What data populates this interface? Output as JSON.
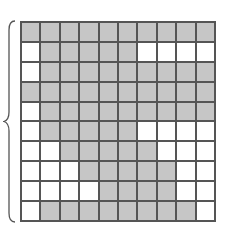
{
  "figure": {
    "rows": 10,
    "cols": 10,
    "colors": {
      "shaded": "#c6c6c6",
      "empty": "#ffffff",
      "line": "#555555"
    },
    "grid": [
      [
        1,
        1,
        1,
        1,
        1,
        1,
        1,
        1,
        1,
        1
      ],
      [
        0,
        1,
        1,
        1,
        1,
        1,
        0,
        0,
        0,
        0
      ],
      [
        0,
        1,
        1,
        1,
        1,
        1,
        1,
        1,
        1,
        1
      ],
      [
        1,
        1,
        1,
        1,
        1,
        1,
        1,
        1,
        1,
        1
      ],
      [
        0,
        1,
        1,
        1,
        1,
        1,
        1,
        1,
        1,
        1
      ],
      [
        0,
        1,
        1,
        1,
        1,
        1,
        0,
        0,
        0,
        0
      ],
      [
        0,
        0,
        1,
        1,
        1,
        1,
        1,
        0,
        0,
        0
      ],
      [
        0,
        0,
        0,
        1,
        1,
        1,
        1,
        1,
        0,
        0
      ],
      [
        0,
        0,
        0,
        0,
        1,
        1,
        1,
        1,
        0,
        0
      ],
      [
        0,
        1,
        1,
        1,
        1,
        1,
        1,
        1,
        1,
        0
      ]
    ],
    "brace": "left-curly-brace"
  }
}
